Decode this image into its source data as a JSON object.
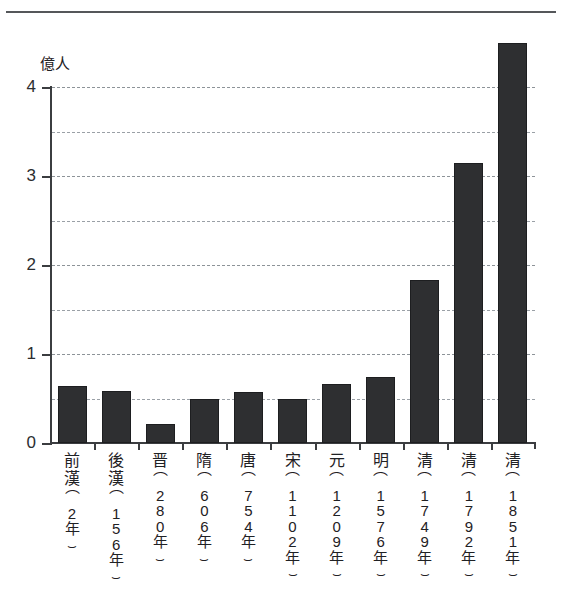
{
  "chart_data": {
    "type": "bar",
    "title": "",
    "xlabel": "",
    "ylabel": "億人",
    "ylim": [
      0,
      4.6
    ],
    "yticks": [
      0,
      1,
      2,
      3,
      4
    ],
    "ytick_labels": [
      "0",
      "1",
      "2",
      "3",
      "4"
    ],
    "gridlines": [
      0.5,
      1.0,
      1.5,
      2.0,
      2.5,
      3.0,
      3.5,
      4.0
    ],
    "grid": true,
    "legend": "none",
    "bar_color": "#2e2f31",
    "categories": [
      "前漢（2年）",
      "後漢（156年）",
      "晋（280年）",
      "隋（606年）",
      "唐（754年）",
      "宋（1102年）",
      "元（1209年）",
      "明（1576年）",
      "清（1749年）",
      "清（1792年）",
      "清（1851年）"
    ],
    "values": [
      0.64,
      0.58,
      0.21,
      0.49,
      0.57,
      0.5,
      0.66,
      0.74,
      1.83,
      3.15,
      4.5
    ]
  },
  "axis": {
    "unit_label": "億人",
    "y_labels": [
      "4",
      "3",
      "2",
      "1",
      "0"
    ]
  },
  "bars": [
    {
      "era": "前漢",
      "year": "（2年）",
      "value": 0.64
    },
    {
      "era": "後漢",
      "year": "（156年）",
      "value": 0.58
    },
    {
      "era": "晋",
      "year": "（280年）",
      "value": 0.21
    },
    {
      "era": "隋",
      "year": "（606年）",
      "value": 0.49
    },
    {
      "era": "唐",
      "year": "（754年）",
      "value": 0.57
    },
    {
      "era": "宋",
      "year": "（1102年）",
      "value": 0.5
    },
    {
      "era": "元",
      "year": "（1209年）",
      "value": 0.66
    },
    {
      "era": "明",
      "year": "（1576年）",
      "value": 0.74
    },
    {
      "era": "清",
      "year": "（1749年）",
      "value": 1.83
    },
    {
      "era": "清",
      "year": "（1792年）",
      "value": 3.15
    },
    {
      "era": "清",
      "year": "（1851年）",
      "value": 4.5
    }
  ]
}
